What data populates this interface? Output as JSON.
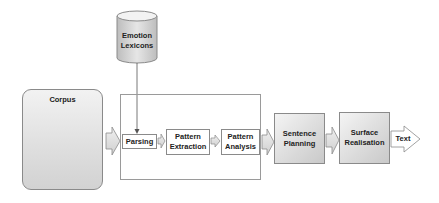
{
  "diagram": {
    "lexicon": {
      "label_line1": "Emotion",
      "label_line2": "Lexicons"
    },
    "corpus": {
      "label": "Corpus"
    },
    "pipeline": {
      "parsing": {
        "label": "Parsing"
      },
      "pattern_extraction": {
        "label_line1": "Pattern",
        "label_line2": "Extraction"
      },
      "pattern_analysis": {
        "label_line1": "Pattern",
        "label_line2": "Analysis"
      }
    },
    "sentence_planning": {
      "label_line1": "Sentence",
      "label_line2": "Planning"
    },
    "surface_realisation": {
      "label_line1": "Surface",
      "label_line2": "Realisation"
    },
    "output": {
      "label": "Text"
    },
    "colors": {
      "node_fill": "#7f7f7f",
      "box_border": "#8a8a8a",
      "arrow_fill": "#d9d9d9",
      "edge_line": "#b5b5b5"
    }
  }
}
